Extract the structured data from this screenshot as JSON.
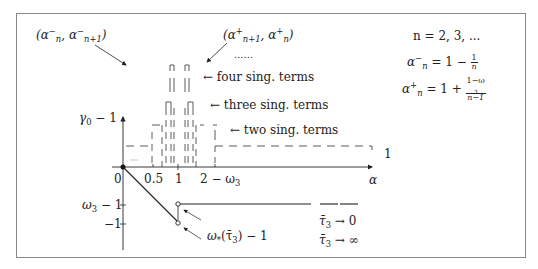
{
  "diagram": {
    "annotations": {
      "left_interval": "(α_n^-, α_{n+1}^-)",
      "right_interval": "(α_{n+1}^+, α_n^+)",
      "ellipsis": "......",
      "four_terms": "← four sing. terms",
      "three_terms": "← three sing. terms",
      "two_terms": "← two sing. terms",
      "one_term": "← one sing. term"
    },
    "definitions": {
      "n_range": "n = 2, 3, ...",
      "alpha_minus": "α_n^- = 1 − 1/n",
      "alpha_plus": "α_n^+ = 1 + (1−ω_3)/(n−1)"
    },
    "axes": {
      "x_label": "α",
      "y_label": "γ_0 − 1",
      "x_ticks": [
        "0",
        "0.5",
        "1",
        "2 − ω_3"
      ],
      "y_ticks": [
        "ω_3 − 1",
        "−1"
      ]
    },
    "curves": {
      "omega_star": "ω_*(τ̄_3) − 1",
      "tau_zero": "τ̄_3 → 0",
      "tau_inf": "τ̄_3 → ∞"
    }
  },
  "text": {
    "paren_open": "(",
    "paren_close": ")",
    "comma": ",",
    "alpha": "α",
    "n": "n",
    "n1": "n+1",
    "minus": "−",
    "plus": "+",
    "ellipsis": "......",
    "four": "← four sing. terms",
    "three": "← three sing. terms",
    "two": "← two sing. terms",
    "one": "1",
    "n_eq": "n = 2, 3, ...",
    "eq_one_minus": "= 1 −",
    "eq_one_plus": "= 1 +",
    "one_minus_w3": "1−ω",
    "three_sub": "3",
    "n_minus_1": "n−1",
    "gamma": "γ",
    "zero_sub": "0",
    "minus_one_suffix": " − 1",
    "x0": "0",
    "x05": "0.5",
    "x1": "1",
    "x2w_prefix": "2 − ω",
    "omega": "ω",
    "y_w3": "ω",
    "y_neg1": "−1",
    "omega_star": "ω",
    "star": "*",
    "tau": "τ̄",
    "tau_paren": "(τ̄",
    "to_zero": " → 0",
    "to_inf": " → ∞",
    "paren_close_minus1": ") − 1"
  },
  "one_term_label": "← one sing. term"
}
